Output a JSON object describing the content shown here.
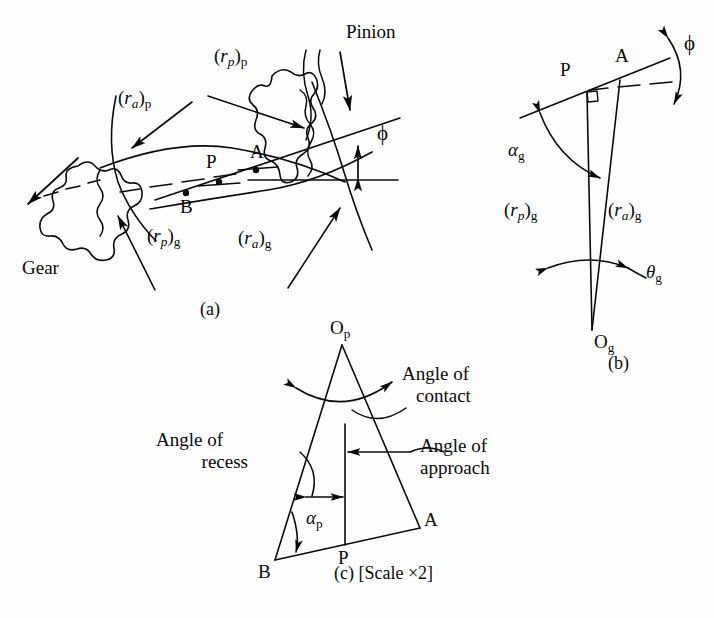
{
  "figure": {
    "background_color": "#fefefe",
    "line_color": "#0a0a0a"
  },
  "panel_a": {
    "caption": "(a)",
    "labels": {
      "pinion": "Pinion",
      "gear": "Gear",
      "r_p_pinion": "(r<i>p</i>)<sub>p</sub>",
      "r_a_pinion": "(r<i>a</i>)<sub>p</sub>",
      "r_p_gear": "(r<i>p</i>)<sub>g</sub>",
      "r_a_gear": "(r<i>a</i>)<sub>g</sub>",
      "phi": "ϕ"
    },
    "points": {
      "A": "A",
      "B": "B",
      "P": "P"
    }
  },
  "panel_b": {
    "caption": "(b)",
    "labels": {
      "alpha_g": "αg",
      "theta_g": "θg",
      "phi": "ϕ",
      "r_p_gear": "(rp)g",
      "r_a_gear": "(ra)g"
    },
    "points": {
      "P": "P",
      "A": "A",
      "O_g": "Og"
    }
  },
  "panel_c": {
    "caption": "(c) [Scale ×2]",
    "labels": {
      "angle_of_contact_line1": "Angle of",
      "angle_of_contact_line2": "contact",
      "angle_of_recess_line1": "Angle of",
      "angle_of_recess_line2": "recess",
      "angle_of_approach_line1": "Angle of",
      "angle_of_approach_line2": "approach",
      "alpha_p": "αp"
    },
    "points": {
      "O_p": "Op",
      "A": "A",
      "B": "B",
      "P": "P"
    }
  }
}
